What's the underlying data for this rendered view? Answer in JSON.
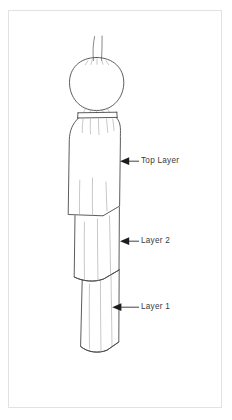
{
  "figure": {
    "background_color": "#ffffff",
    "frame_color": "#e2e2e2",
    "line_color": "#4a4a4a",
    "detail_line_color": "#8c8c8c",
    "label_color": "#3a3a3a"
  },
  "annotations": [
    {
      "id": "top-layer",
      "label": "Top Layer",
      "arrow": "left-pointing-triangle",
      "leader_x_start": 128,
      "leader_x_end": 139,
      "leader_y": 161
    },
    {
      "id": "layer-2",
      "label": "Layer 2",
      "arrow": "left-pointing-triangle",
      "leader_x_start": 128,
      "leader_x_end": 139,
      "leader_y": 241
    },
    {
      "id": "layer-1",
      "label": "Layer 1",
      "arrow": "left-pointing-triangle",
      "leader_x_start": 120,
      "leader_x_end": 139,
      "leader_y": 307
    }
  ],
  "parts": {
    "hair_strands": 2,
    "head": "oval",
    "collar_band": "horizontal neck band",
    "top_layer": "widest upper garment with angled hem",
    "layer_2": "middle garment panel with curved hem",
    "layer_1": "narrow lower garment with curved hem"
  }
}
